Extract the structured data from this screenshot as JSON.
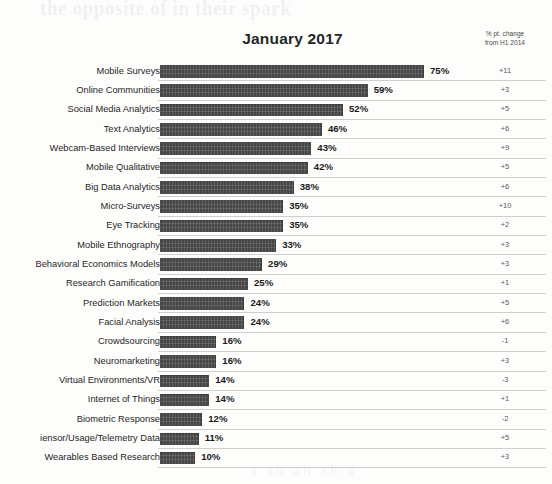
{
  "page": {
    "ghost_text_top": "the opposite of in their spark",
    "ghost_text_bottom": "a ah ah ah a"
  },
  "header": {
    "title": "January 2017",
    "delta_column_line1": "% pt. change",
    "delta_column_line2": "from H1 2014"
  },
  "chart_data": {
    "type": "bar",
    "orientation": "horizontal",
    "title": "January 2017",
    "xlabel": "",
    "ylabel": "",
    "xlim": [
      0,
      80
    ],
    "grid": false,
    "legend": null,
    "categories": [
      "Mobile Surveys",
      "Online Communities",
      "Social Media Analytics",
      "Text Analytics",
      "Webcam-Based Interviews",
      "Mobile Qualitative",
      "Big Data Analytics",
      "Micro-Surveys",
      "Eye Tracking",
      "Mobile Ethnography",
      "Behavioral Economics Models",
      "Research Gamification",
      "Prediction Markets",
      "Facial Analysis",
      "Crowdsourcing",
      "Neuromarketing",
      "Virtual Environments/VR",
      "Internet of Things",
      "Biometric Response",
      "iensor/Usage/Telemetry Data",
      "Wearables Based Research"
    ],
    "values": [
      75,
      59,
      52,
      46,
      43,
      42,
      38,
      35,
      35,
      33,
      29,
      25,
      24,
      24,
      16,
      16,
      14,
      14,
      12,
      11,
      10
    ],
    "value_labels": [
      "75%",
      "59%",
      "52%",
      "46%",
      "43%",
      "42%",
      "38%",
      "35%",
      "35%",
      "33%",
      "29%",
      "25%",
      "24%",
      "24%",
      "16%",
      "16%",
      "14%",
      "14%",
      "12%",
      "11%",
      "10%"
    ],
    "delta_labels": [
      "+11",
      "+3",
      "+5",
      "+6",
      "+9",
      "+5",
      "+6",
      "+10",
      "+2",
      "+3",
      "+3",
      "+1",
      "+5",
      "+6",
      "-1",
      "+3",
      "-3",
      "+1",
      "-2",
      "+5",
      "+3"
    ],
    "delta_series_name": "% pt. change from H1 2014",
    "bar_color": "#4b4b4b"
  }
}
